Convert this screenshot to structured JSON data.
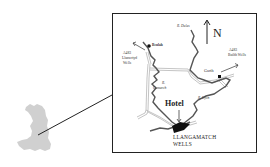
{
  "map": {
    "title": "Location map",
    "inset": {
      "region": "Wales",
      "fill": "#cfcfcf"
    },
    "north_label": "N",
    "places": {
      "beulah": "Beulah",
      "garth": "Garth",
      "hotel": "Hotel",
      "town_line1": "LLANGAMATCH",
      "town_line2": "WELLS"
    },
    "roads": {
      "west_road": "A483",
      "west_dest": "Llanwrtyd",
      "west_dest2": "Wells",
      "east_road": "A483",
      "east_dest": "Builth Wells"
    },
    "rivers": {
      "dulas": "R. Dulas",
      "camarch_r": "R.",
      "camarch": "Camarch",
      "irfon": "R. Irfon"
    },
    "colors": {
      "river": "#555555",
      "road": "#aaaaaa",
      "border": "#222222",
      "town": "#111111"
    }
  }
}
